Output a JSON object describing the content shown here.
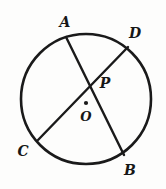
{
  "figure": {
    "background_color": "#fdfdfc",
    "stroke_color": "#1a1a1a",
    "circle": {
      "center_x": 86,
      "center_y": 99,
      "radius": 65,
      "stroke_width": 2.6,
      "name": "circle-O"
    },
    "center_dot": {
      "x": 86,
      "y": 103,
      "radius": 2.1
    },
    "chords": [
      {
        "name": "chord-AB",
        "from": "A",
        "to": "B",
        "x1": 66,
        "y1": 37,
        "x2": 124,
        "y2": 155,
        "stroke_width": 2.4
      },
      {
        "name": "chord-CD",
        "from": "C",
        "to": "D",
        "x1": 38,
        "y1": 140,
        "x2": 128,
        "y2": 47,
        "stroke_width": 2.4
      }
    ],
    "intersection": {
      "name": "point-P",
      "x": 95,
      "y": 84
    },
    "labels": [
      {
        "id": "A",
        "text": "A",
        "x": 65,
        "y": 22,
        "size": "normal"
      },
      {
        "id": "D",
        "text": "D",
        "x": 135,
        "y": 33,
        "size": "normal"
      },
      {
        "id": "P",
        "text": "P",
        "x": 105,
        "y": 83,
        "size": "normal"
      },
      {
        "id": "O",
        "text": "O",
        "x": 86,
        "y": 116,
        "size": "small"
      },
      {
        "id": "C",
        "text": "C",
        "x": 23,
        "y": 151,
        "size": "normal"
      },
      {
        "id": "B",
        "text": "B",
        "x": 130,
        "y": 170,
        "size": "normal"
      }
    ]
  }
}
